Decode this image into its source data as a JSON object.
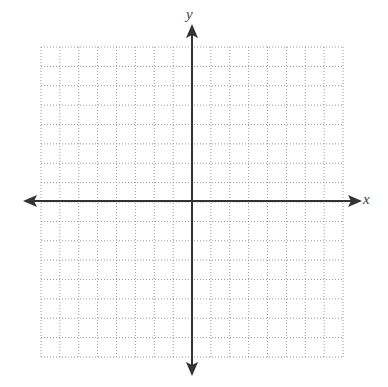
{
  "figure": {
    "type": "coordinate-plane",
    "x_axis_label": "x",
    "y_axis_label": "y",
    "grid": {
      "columns": 16,
      "rows": 16,
      "line_style": "dotted",
      "line_color": "#9a9a9a"
    },
    "axis_color": "#333333",
    "origin_column": 8,
    "origin_row": 8
  }
}
